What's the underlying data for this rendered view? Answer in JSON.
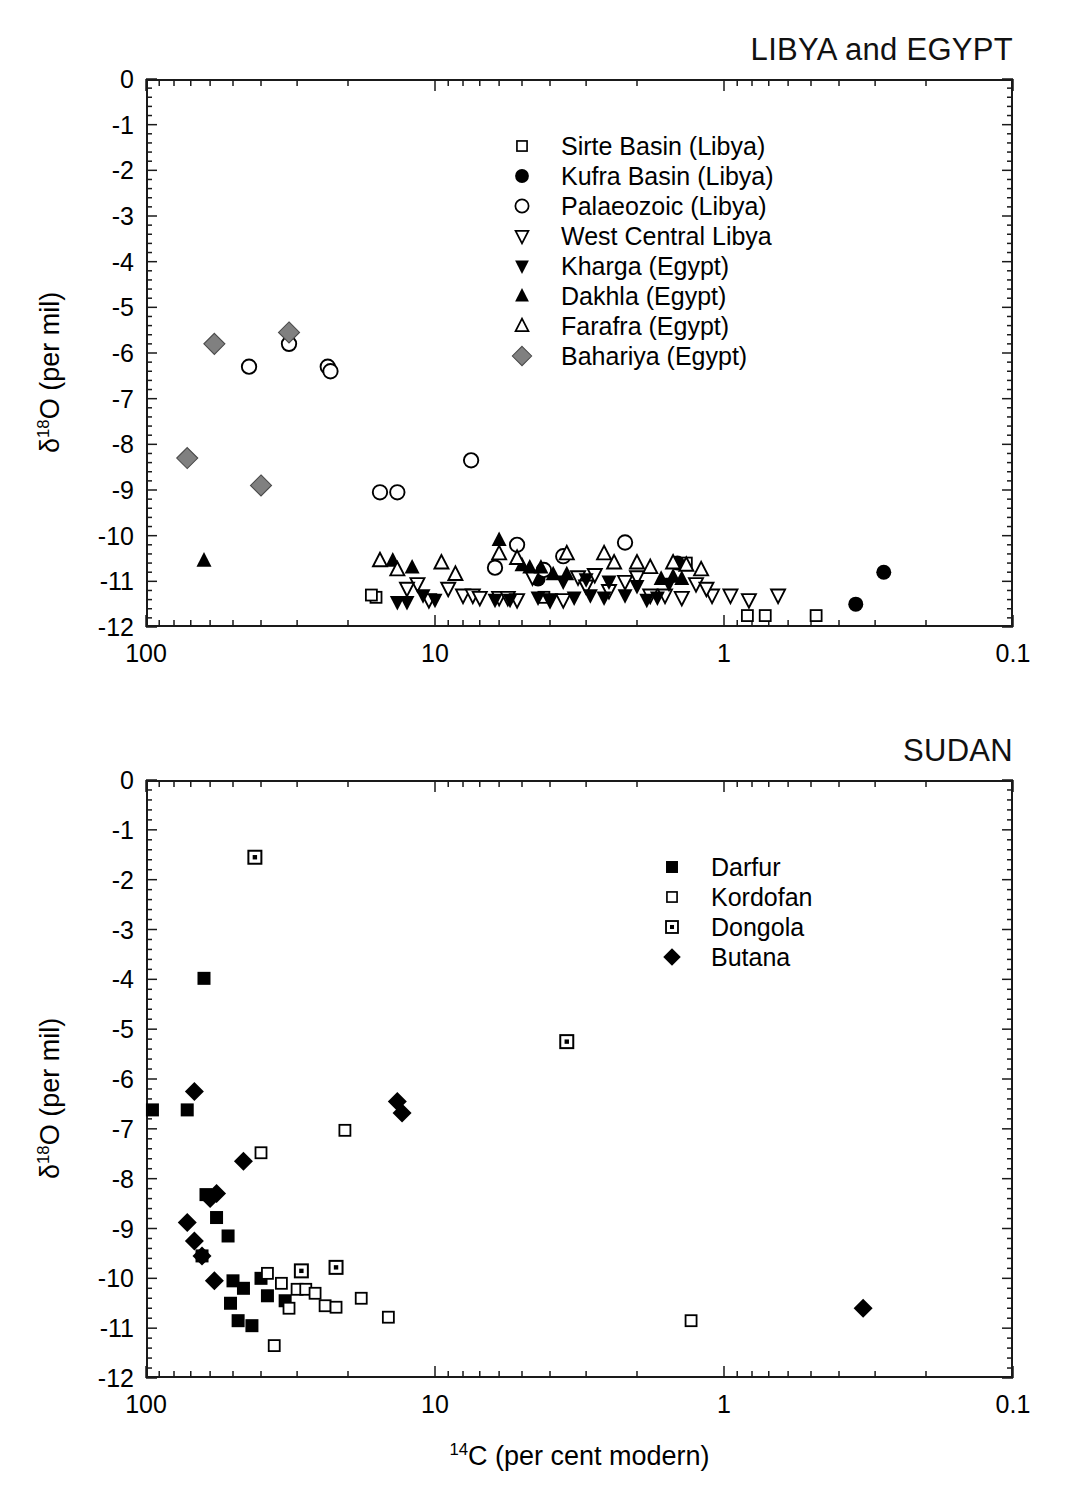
{
  "figure": {
    "axis_title_y": "δ¹18O (per mil)",
    "axis_title_x": "14C (per cent modern)",
    "caption": ""
  },
  "chart_data": [
    {
      "type": "scatter",
      "title": "LIBYA and EGYPT",
      "xlabel": "14C (per cent modern)",
      "ylabel": "δ18O (per mil)",
      "xscale": "log",
      "xlim": [
        100,
        0.1
      ],
      "ylim": [
        -12,
        0
      ],
      "x_ticks": [
        "100",
        "10",
        "1",
        "0.1"
      ],
      "y_ticks": [
        "0",
        "-1",
        "-2",
        "-3",
        "-4",
        "-5",
        "-6",
        "-7",
        "-8",
        "-9",
        "-10",
        "-11",
        "-12"
      ],
      "grid": false,
      "legend_position": "upper-right",
      "series": [
        {
          "name": "Sirte Basin (Libya)",
          "marker": "open-square",
          "points": [
            [
              16.0,
              -11.35
            ],
            [
              16.6,
              -11.3
            ],
            [
              4.2,
              -11.35
            ],
            [
              1.35,
              -10.6
            ],
            [
              0.83,
              -11.75
            ],
            [
              0.72,
              -11.75
            ],
            [
              0.48,
              -11.75
            ]
          ]
        },
        {
          "name": "Kufra Basin (Libya)",
          "marker": "filled-circle",
          "points": [
            [
              1.45,
              -10.6
            ],
            [
              0.35,
              -11.5
            ],
            [
              0.28,
              -10.8
            ],
            [
              4.4,
              -10.95
            ]
          ]
        },
        {
          "name": "Palaeozoic (Libya)",
          "marker": "open-circle",
          "points": [
            [
              32.0,
              -5.8
            ],
            [
              44.0,
              -6.3
            ],
            [
              23.5,
              -6.3
            ],
            [
              23.0,
              -6.4
            ],
            [
              15.5,
              -9.05
            ],
            [
              13.5,
              -9.05
            ],
            [
              7.5,
              -8.35
            ],
            [
              5.2,
              -10.2
            ],
            [
              3.6,
              -10.45
            ],
            [
              2.2,
              -10.15
            ],
            [
              4.2,
              -10.75
            ],
            [
              6.2,
              -10.7
            ]
          ]
        },
        {
          "name": "West Central Libya",
          "marker": "open-triangle-down",
          "points": [
            [
              9.0,
              -11.15
            ],
            [
              8.0,
              -11.3
            ],
            [
              7.4,
              -11.3
            ],
            [
              7.0,
              -11.35
            ],
            [
              6.0,
              -11.35
            ],
            [
              5.6,
              -11.35
            ],
            [
              5.2,
              -11.4
            ],
            [
              4.6,
              -10.9
            ],
            [
              4.0,
              -11.4
            ],
            [
              3.6,
              -11.4
            ],
            [
              3.2,
              -10.9
            ],
            [
              3.0,
              -11.1
            ],
            [
              2.8,
              -10.85
            ],
            [
              2.5,
              -11.2
            ],
            [
              2.2,
              -11.0
            ],
            [
              2.0,
              -10.9
            ],
            [
              1.8,
              -11.3
            ],
            [
              1.6,
              -11.3
            ],
            [
              1.4,
              -11.35
            ],
            [
              1.25,
              -11.05
            ],
            [
              1.1,
              -11.3
            ],
            [
              0.95,
              -11.3
            ],
            [
              0.82,
              -11.4
            ],
            [
              0.65,
              -11.3
            ],
            [
              11.5,
              -11.05
            ],
            [
              12.5,
              -11.15
            ],
            [
              10.5,
              -11.4
            ],
            [
              1.15,
              -11.15
            ]
          ]
        },
        {
          "name": "Kharga (Egypt)",
          "marker": "filled-triangle-down",
          "points": [
            [
              13.5,
              -11.45
            ],
            [
              12.5,
              -11.45
            ],
            [
              11.0,
              -11.3
            ],
            [
              10.0,
              -11.4
            ],
            [
              6.2,
              -11.4
            ],
            [
              5.5,
              -11.4
            ],
            [
              4.4,
              -11.35
            ],
            [
              4.0,
              -11.4
            ],
            [
              3.3,
              -11.35
            ],
            [
              2.9,
              -11.3
            ],
            [
              2.6,
              -11.35
            ],
            [
              2.2,
              -11.3
            ],
            [
              1.85,
              -11.4
            ],
            [
              1.7,
              -11.35
            ],
            [
              3.6,
              -11.0
            ],
            [
              3.0,
              -10.95
            ],
            [
              2.5,
              -11.0
            ],
            [
              2.0,
              -11.1
            ],
            [
              1.55,
              -11.05
            ]
          ]
        },
        {
          "name": "Dakhla (Egypt)",
          "marker": "filled-triangle-up",
          "points": [
            [
              6.0,
              -10.1
            ],
            [
              14.0,
              -10.55
            ],
            [
              12.0,
              -10.7
            ],
            [
              5.0,
              -10.65
            ],
            [
              4.7,
              -10.7
            ],
            [
              4.3,
              -10.7
            ],
            [
              3.9,
              -10.85
            ],
            [
              3.5,
              -10.85
            ],
            [
              1.65,
              -10.95
            ],
            [
              1.5,
              -10.9
            ],
            [
              1.4,
              -10.95
            ],
            [
              63.0,
              -10.55
            ]
          ]
        },
        {
          "name": "Farafra (Egypt)",
          "marker": "open-triangle-up",
          "points": [
            [
              15.5,
              -10.55
            ],
            [
              13.5,
              -10.75
            ],
            [
              6.0,
              -10.4
            ],
            [
              5.2,
              -10.5
            ],
            [
              3.5,
              -10.4
            ],
            [
              2.6,
              -10.4
            ],
            [
              2.4,
              -10.6
            ],
            [
              2.0,
              -10.6
            ],
            [
              1.8,
              -10.7
            ],
            [
              1.5,
              -10.6
            ],
            [
              1.35,
              -10.65
            ],
            [
              1.2,
              -10.75
            ],
            [
              9.5,
              -10.6
            ],
            [
              8.5,
              -10.85
            ]
          ]
        },
        {
          "name": "Bahariya (Egypt)",
          "marker": "gray-diamond",
          "points": [
            [
              58.0,
              -5.8
            ],
            [
              32.0,
              -5.55
            ],
            [
              72.0,
              -8.3
            ],
            [
              40.0,
              -8.9
            ]
          ]
        }
      ]
    },
    {
      "type": "scatter",
      "title": "SUDAN",
      "xlabel": "14C (per cent modern)",
      "ylabel": "δ18O (per mil)",
      "xscale": "log",
      "xlim": [
        100,
        0.1
      ],
      "ylim": [
        -12,
        0
      ],
      "x_ticks": [
        "100",
        "10",
        "1",
        "0.1"
      ],
      "y_ticks": [
        "0",
        "-1",
        "-2",
        "-3",
        "-4",
        "-5",
        "-6",
        "-7",
        "-8",
        "-9",
        "-10",
        "-11",
        "-12"
      ],
      "grid": false,
      "legend_position": "upper-right",
      "series": [
        {
          "name": "Darfur",
          "marker": "filled-square",
          "points": [
            [
              63.0,
              -3.98
            ],
            [
              110.0,
              -6.2
            ],
            [
              95.0,
              -6.62
            ],
            [
              72.0,
              -6.62
            ],
            [
              62.0,
              -8.32
            ],
            [
              57.0,
              -8.78
            ],
            [
              115.0,
              -8.85
            ],
            [
              52.0,
              -9.15
            ],
            [
              64.0,
              -9.55
            ],
            [
              50.0,
              -10.05
            ],
            [
              46.0,
              -10.2
            ],
            [
              38.0,
              -10.35
            ],
            [
              33.0,
              -10.45
            ],
            [
              51.0,
              -10.5
            ],
            [
              48.0,
              -10.85
            ],
            [
              43.0,
              -10.95
            ],
            [
              40.0,
              -10.0
            ]
          ]
        },
        {
          "name": "Kordofan",
          "marker": "open-square",
          "points": [
            [
              135.0,
              -4.47
            ],
            [
              40.0,
              -7.48
            ],
            [
              20.5,
              -7.03
            ],
            [
              38.0,
              -9.9
            ],
            [
              34.0,
              -10.1
            ],
            [
              30.0,
              -10.22
            ],
            [
              28.0,
              -10.22
            ],
            [
              26.0,
              -10.3
            ],
            [
              24.0,
              -10.55
            ],
            [
              22.0,
              -10.58
            ],
            [
              18.0,
              -10.4
            ],
            [
              14.5,
              -10.78
            ],
            [
              36.0,
              -11.35
            ],
            [
              1.3,
              -10.85
            ],
            [
              32.0,
              -10.6
            ]
          ]
        },
        {
          "name": "Dongola",
          "marker": "dotted-square",
          "points": [
            [
              42.0,
              -1.55
            ],
            [
              3.5,
              -5.25
            ],
            [
              22.0,
              -9.78
            ],
            [
              29.0,
              -9.85
            ]
          ]
        },
        {
          "name": "Butana",
          "marker": "filled-diamond",
          "points": [
            [
              68.0,
              -6.25
            ],
            [
              13.5,
              -6.45
            ],
            [
              13.0,
              -6.68
            ],
            [
              46.0,
              -7.65
            ],
            [
              57.0,
              -8.3
            ],
            [
              60.0,
              -8.4
            ],
            [
              72.0,
              -8.88
            ],
            [
              68.0,
              -9.25
            ],
            [
              64.0,
              -9.55
            ],
            [
              58.0,
              -10.05
            ],
            [
              0.33,
              -10.6
            ]
          ]
        }
      ]
    }
  ],
  "panels": [
    {
      "title": "LIBYA and EGYPT",
      "legend": [
        {
          "label": "Sirte Basin (Libya)",
          "marker": "open-square"
        },
        {
          "label": "Kufra Basin (Libya)",
          "marker": "filled-circle"
        },
        {
          "label": "Palaeozoic (Libya)",
          "marker": "open-circle"
        },
        {
          "label": "West Central Libya",
          "marker": "open-triangle-down"
        },
        {
          "label": "Kharga (Egypt)",
          "marker": "filled-triangle-down"
        },
        {
          "label": "Dakhla (Egypt)",
          "marker": "filled-triangle-up"
        },
        {
          "label": "Farafra (Egypt)",
          "marker": "open-triangle-up"
        },
        {
          "label": "Bahariya (Egypt)",
          "marker": "gray-diamond"
        }
      ]
    },
    {
      "title": "SUDAN",
      "legend": [
        {
          "label": "Darfur",
          "marker": "filled-square"
        },
        {
          "label": "Kordofan",
          "marker": "open-square"
        },
        {
          "label": "Dongola",
          "marker": "dotted-square"
        },
        {
          "label": "Butana",
          "marker": "filled-diamond"
        }
      ]
    }
  ],
  "colors": {
    "axis": "#1a1a1a",
    "marker_fill": "#000000",
    "marker_gray": "#808080",
    "background": "#ffffff"
  }
}
